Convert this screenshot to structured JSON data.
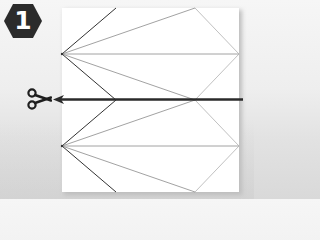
{
  "step": {
    "number": "1",
    "badge_color": "#2b2b2b",
    "badge_text_color": "#ffffff"
  },
  "paper": {
    "color": "#ffffff",
    "fold_lines": {
      "dark_color": "#333333",
      "light_color": "#9a9a9a"
    }
  },
  "cut": {
    "icon": "scissors-icon",
    "line_color": "#2a2a2a",
    "direction": "left"
  }
}
